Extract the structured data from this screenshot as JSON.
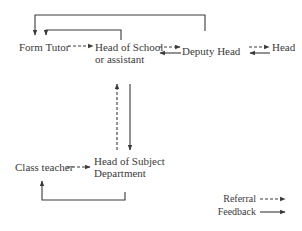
{
  "diagram": {
    "nodes": {
      "form_tutor": "Form Tutor",
      "head_of_school_line1": "Head of School",
      "head_of_school_line2": "or assistant",
      "deputy_head": "Deputy Head",
      "head": "Head",
      "class_teacher": "Class teacher",
      "head_of_subject_line1": "Head of Subject",
      "head_of_subject_line2": "Department"
    },
    "edges": [
      {
        "from": "Form Tutor",
        "to": "Head of School or assistant",
        "type": "referral"
      },
      {
        "from": "Head of School or assistant",
        "to": "Deputy Head",
        "type": "referral"
      },
      {
        "from": "Deputy Head",
        "to": "Head of School or assistant",
        "type": "feedback"
      },
      {
        "from": "Deputy Head",
        "to": "Head",
        "type": "referral"
      },
      {
        "from": "Head",
        "to": "Deputy Head",
        "type": "feedback"
      },
      {
        "from": "Head of School or assistant",
        "to": "Form Tutor",
        "type": "feedback"
      },
      {
        "from": "Deputy Head",
        "to": "Form Tutor",
        "type": "feedback"
      },
      {
        "from": "Head of Subject Department",
        "to": "Head of School or assistant",
        "type": "referral"
      },
      {
        "from": "Head of School or assistant",
        "to": "Head of Subject Department",
        "type": "feedback"
      },
      {
        "from": "Class teacher",
        "to": "Head of Subject Department",
        "type": "referral"
      },
      {
        "from": "Head of Subject Department",
        "to": "Class teacher",
        "type": "feedback"
      }
    ],
    "legend": {
      "referral": "Referral",
      "feedback": "Feedback"
    },
    "colors": {
      "line": "#3a3a3a",
      "text": "#3a3a3a",
      "background": "#ffffff"
    }
  }
}
